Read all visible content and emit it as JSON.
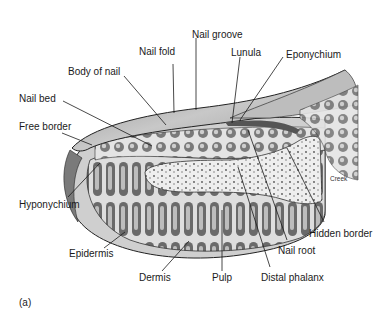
{
  "figure": {
    "panel_label": "(a)",
    "watermark": "Creek",
    "labels": {
      "nail_groove": "Nail groove",
      "nail_fold": "Nail fold",
      "lunula": "Lunula",
      "eponychium": "Eponychium",
      "body_of_nail": "Body of nail",
      "nail_bed": "Nail bed",
      "free_border": "Free border",
      "hyponychium": "Hyponychium",
      "epidermis": "Epidermis",
      "dermis": "Dermis",
      "pulp": "Pulp",
      "distal_phalanx": "Distal phalanx",
      "nail_root": "Nail root",
      "hidden_border": "Hidden border"
    },
    "colors": {
      "ink": "#1a1a1a",
      "shade_dark": "#6e6e6e",
      "shade_mid": "#a8a8a8",
      "shade_light": "#d6d6d6"
    }
  }
}
